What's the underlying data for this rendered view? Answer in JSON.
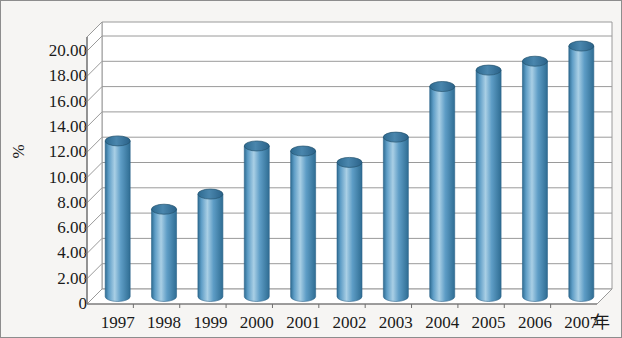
{
  "chart_data": {
    "type": "bar",
    "title": "",
    "subtitle": "",
    "xlabel": "年",
    "ylabel": "%",
    "categories": [
      "1997",
      "1998",
      "1999",
      "2000",
      "2001",
      "2002",
      "2003",
      "2004",
      "2005",
      "2006",
      "2007"
    ],
    "values": [
      12.3,
      6.9,
      8.1,
      11.9,
      11.5,
      10.6,
      12.6,
      16.6,
      17.9,
      18.6,
      19.8
    ],
    "series": [
      {
        "name": "",
        "values": [
          12.3,
          6.9,
          8.1,
          11.9,
          11.5,
          10.6,
          12.6,
          16.6,
          17.9,
          18.6,
          19.8
        ]
      }
    ],
    "ylim": [
      0,
      20
    ],
    "ytick_labels": [
      "0",
      "2.00",
      "4.00",
      "6.00",
      "8.00",
      "10.00",
      "12.00",
      "14.00",
      "16.00",
      "18.00",
      "20.00"
    ],
    "ytick_values": [
      0,
      2,
      4,
      6,
      8,
      10,
      12,
      14,
      16,
      18,
      20
    ],
    "grid": true,
    "legend": false,
    "legend_position": "none",
    "style": "3d-cylinder",
    "bar_color": "#5e9dc6",
    "bar_color_light": "#a9cfe5",
    "bar_color_dark": "#2f6d93",
    "bar_top_color": "#3c7ba3",
    "grid_color": "#9a9a9a",
    "axis_color": "#6f6f6f",
    "background_color": "#f6f5f3",
    "text_color": "#1a1a1a"
  }
}
